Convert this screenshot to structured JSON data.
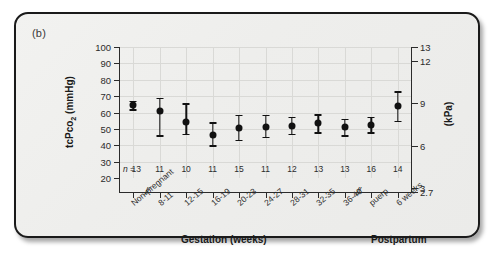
{
  "panel": {
    "label": "(b)"
  },
  "chart_data": {
    "type": "scatter",
    "title": "",
    "subtitle": "",
    "ylabel": "tcPco2 (mmHg)",
    "ylabel_secondary": "(kPa)",
    "xlabel_primary": "Gestation (weeks)",
    "xlabel_secondary": "Postpartum",
    "grid": true,
    "legend": "none",
    "ylim": [
      20,
      100
    ],
    "ylim_secondary": [
      2.7,
      13
    ],
    "yticks": [
      100,
      90,
      80,
      70,
      60,
      50,
      40,
      30,
      20
    ],
    "yticks_secondary": [
      13,
      12,
      9,
      6,
      3,
      2.7
    ],
    "categories": [
      "Non-pregnant",
      "8-11",
      "12-15",
      "16-19",
      "20-23",
      "24-27",
      "28-31",
      "32-35",
      "36-40",
      "puerp",
      "6 weeks"
    ],
    "n_label": "n =",
    "n_values": [
      13,
      11,
      10,
      11,
      15,
      11,
      12,
      13,
      13,
      16,
      14
    ],
    "series": [
      {
        "name": "tcPco2 mean",
        "values": [
          64.5,
          61.0,
          54.0,
          46.5,
          50.5,
          51.0,
          52.0,
          53.5,
          51.0,
          52.5,
          64.0
        ],
        "err_low": [
          62.0,
          46.0,
          47.0,
          40.0,
          43.5,
          45.0,
          47.0,
          48.0,
          46.0,
          48.0,
          55.0
        ],
        "err_high": [
          67.0,
          69.0,
          65.5,
          54.0,
          58.5,
          58.5,
          57.5,
          59.0,
          56.0,
          57.5,
          73.0
        ]
      }
    ],
    "axis_breaks": [
      {
        "after_category": "Non-pregnant",
        "symbol": "//"
      },
      {
        "after_category": "36-40",
        "symbol": "//"
      }
    ]
  }
}
